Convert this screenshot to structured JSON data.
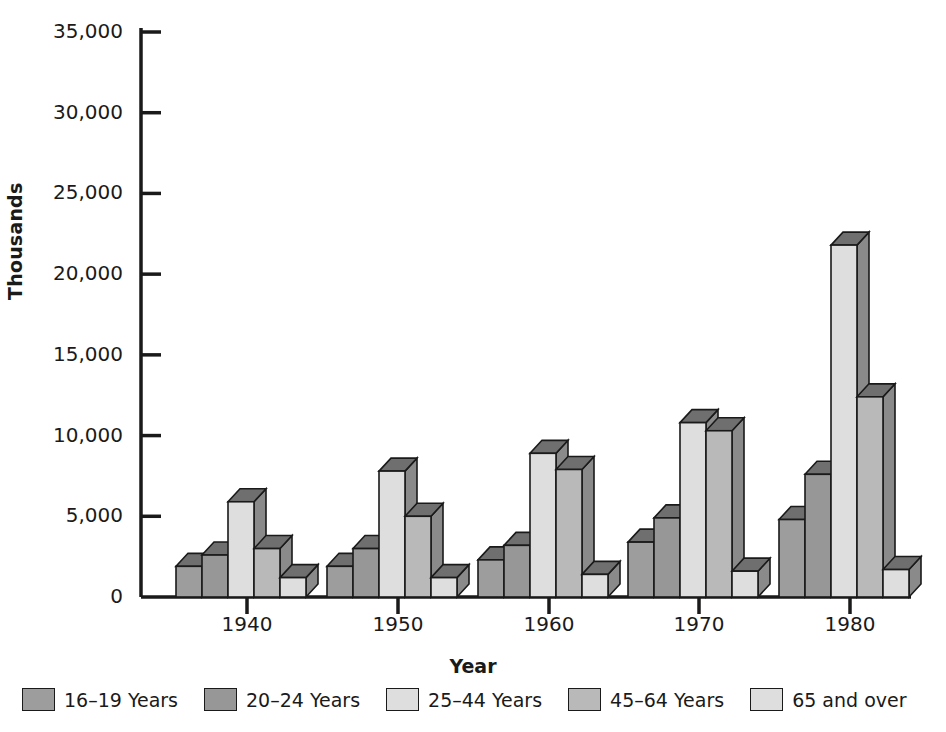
{
  "chart_data": {
    "type": "bar",
    "title": "",
    "xlabel": "Year",
    "ylabel": "Thousands",
    "categories": [
      "1940",
      "1950",
      "1960",
      "1970",
      "1980"
    ],
    "ylim": [
      0,
      35000
    ],
    "yticks": [
      0,
      5000,
      10000,
      15000,
      20000,
      25000,
      30000,
      35000
    ],
    "ytick_labels": [
      "0",
      "5,000",
      "10,000",
      "15,000",
      "20,000",
      "25,000",
      "30,000",
      "35,000"
    ],
    "grid": false,
    "legend_position": "bottom",
    "style": "3d-bars",
    "series": [
      {
        "name": "16–19 Years",
        "color": "#9d9d9d",
        "values": [
          1900,
          1900,
          2300,
          3400,
          4800
        ]
      },
      {
        "name": "20–24 Years",
        "color": "#979797",
        "values": [
          2600,
          3000,
          3200,
          4900,
          7600
        ]
      },
      {
        "name": "25–44 Years",
        "color": "#dedede",
        "values": [
          5900,
          7800,
          8900,
          10800,
          21800
        ]
      },
      {
        "name": "45–64 Years",
        "color": "#b9b9b9",
        "values": [
          3000,
          5000,
          7900,
          10300,
          12400
        ]
      },
      {
        "name": "65 and over",
        "color": "#dedede",
        "values": [
          1200,
          1200,
          1400,
          1600,
          1700
        ]
      }
    ]
  },
  "colors": {
    "axis": "#1a1a1a",
    "background": "#ffffff",
    "bar_outline": "#1a1a1a",
    "bar_top_shade": "#6f6f6f",
    "bar_side_shade": "#8a8a8a"
  }
}
